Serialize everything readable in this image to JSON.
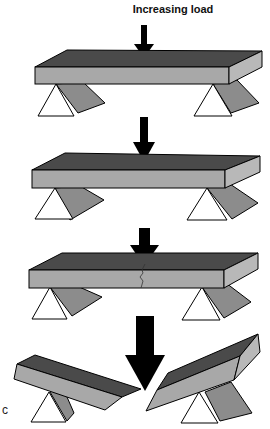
{
  "figure": {
    "title": "Increasing load",
    "panel_label": "c",
    "stages": [
      {
        "name": "unloaded-beam",
        "state": "intact"
      },
      {
        "name": "loaded-beam",
        "state": "intact"
      },
      {
        "name": "cracking-beam",
        "state": "crack"
      },
      {
        "name": "fractured-beam",
        "state": "broken"
      }
    ],
    "colors": {
      "beam_top": "#4a4a4a",
      "beam_front": "#a8a8a8",
      "beam_side": "#b8b8b8",
      "support_front": "#ffffff",
      "support_side": "#8c8c8c",
      "arrow": "#000000"
    }
  }
}
